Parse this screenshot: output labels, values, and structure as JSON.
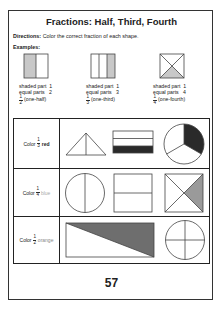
{
  "title": "Fractions: Half, Third, Fourth",
  "directions": {
    "label": "Directions:",
    "text": "Color the correct fraction of each shape."
  },
  "examples_label": "Examples:",
  "examples": [
    {
      "shape": "square-halves",
      "shaded_label": "shaded part",
      "shaded_value": "1",
      "equal_label": "equal parts",
      "equal_value": "2",
      "fraction_num": "1",
      "fraction_den": "2",
      "fraction_name": "(one-half)"
    },
    {
      "shape": "square-thirds",
      "shaded_label": "shaded part",
      "shaded_value": "1",
      "equal_label": "equal parts",
      "equal_value": "3",
      "fraction_num": "1",
      "fraction_den": "3",
      "fraction_name": "(one-third)"
    },
    {
      "shape": "square-fourths",
      "shaded_label": "shaded part",
      "shaded_value": "1",
      "equal_label": "equal parts",
      "equal_value": "4",
      "fraction_num": "1",
      "fraction_den": "4",
      "fraction_name": "(one-fourth)"
    }
  ],
  "rows": [
    {
      "prefix": "Color",
      "num": "1",
      "den": "3",
      "color_word": "red",
      "color_hex": "#222222",
      "shapes": [
        "triangle-halves",
        "rectangle-thirds-shaded",
        "circle-thirds-shaded"
      ]
    },
    {
      "prefix": "Color",
      "num": "1",
      "den": "4",
      "color_word": "blue",
      "color_hex": "#aaaaaa",
      "shapes": [
        "circle-halves",
        "square-halves",
        "square-fourths-shaded"
      ]
    },
    {
      "prefix": "Color",
      "num": "1",
      "den": "2",
      "color_word": "orange",
      "color_hex": "#777777",
      "shapes": [
        "rectangle-diagonal-shaded",
        "circle-fourths"
      ]
    }
  ],
  "page_number": "57",
  "colors": {
    "border": "#222222",
    "shade_light": "#c8c8c8",
    "shade_mid": "#9a9a9a",
    "shade_dark": "#2a2a2a"
  }
}
